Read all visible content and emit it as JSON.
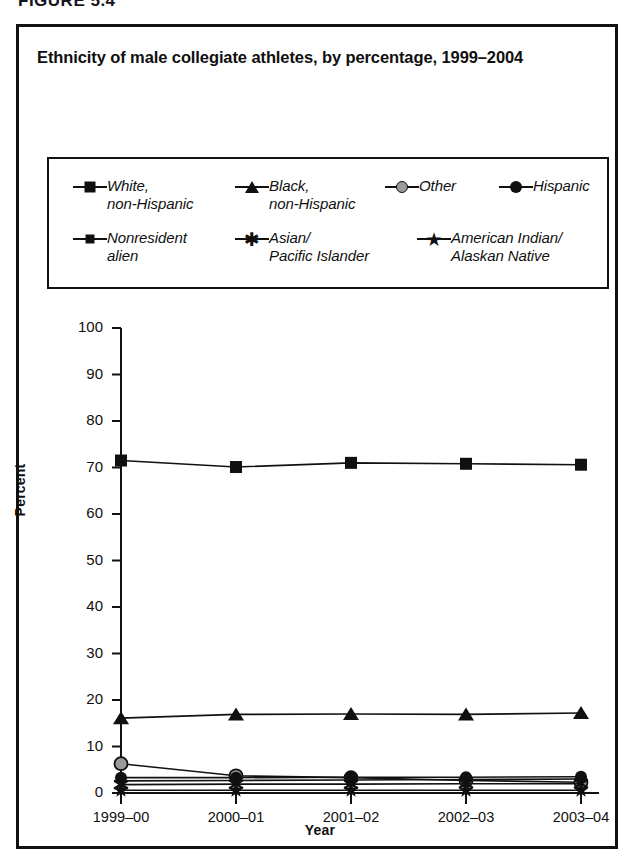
{
  "figure_caption": "FIGURE 5.4",
  "title": "Ethnicity of male collegiate athletes, by percentage, 1999–2004",
  "legend": {
    "items": [
      {
        "label": "White,\nnon-Hispanic",
        "marker": "square-filled-black",
        "color": "#101010"
      },
      {
        "label": "Black,\nnon-Hispanic",
        "marker": "triangle-filled-black",
        "color": "#101010"
      },
      {
        "label": "Other",
        "marker": "circle-filled-gray",
        "color": "#9b9b9b"
      },
      {
        "label": "Hispanic",
        "marker": "circle-filled-black",
        "color": "#101010"
      },
      {
        "label": "Nonresident\nalien",
        "marker": "diamond-filled-black",
        "color": "#101010"
      },
      {
        "label": "Asian/\nPacific Islander",
        "marker": "asterisk-black",
        "color": "#101010"
      },
      {
        "label": "American Indian/\nAlaskan Native",
        "marker": "star-filled-black",
        "color": "#101010"
      }
    ]
  },
  "chart_data": {
    "type": "line",
    "title": "Ethnicity of male collegiate athletes, by percentage, 1999–2004",
    "xlabel": "Year",
    "ylabel": "Percent",
    "categories": [
      "1999–00",
      "2000–01",
      "2001–02",
      "2002–03",
      "2003–04"
    ],
    "ylim": [
      0,
      100
    ],
    "yticks": [
      0,
      10,
      20,
      30,
      40,
      50,
      60,
      70,
      80,
      90,
      100
    ],
    "grid": false,
    "legend_position": "top",
    "series": [
      {
        "name": "White, non-Hispanic",
        "marker": "square-filled-black",
        "color": "#101010",
        "values": [
          71.5,
          70.1,
          71.0,
          70.8,
          70.6
        ]
      },
      {
        "name": "Black, non-Hispanic",
        "marker": "triangle-filled-black",
        "color": "#101010",
        "values": [
          16.1,
          16.9,
          17.0,
          16.9,
          17.2
        ]
      },
      {
        "name": "Other",
        "marker": "circle-filled-gray",
        "color": "#9b9b9b",
        "values": [
          6.3,
          3.7,
          3.3,
          2.7,
          2.3
        ]
      },
      {
        "name": "Hispanic",
        "marker": "circle-filled-black",
        "color": "#101010",
        "values": [
          3.3,
          3.3,
          3.4,
          3.4,
          3.5
        ]
      },
      {
        "name": "Nonresident alien",
        "marker": "diamond-filled-black",
        "color": "#101010",
        "values": [
          2.6,
          2.7,
          2.8,
          2.9,
          3.0
        ]
      },
      {
        "name": "Asian/Pacific Islander",
        "marker": "asterisk-black",
        "color": "#101010",
        "values": [
          1.8,
          1.9,
          1.9,
          2.0,
          2.0
        ]
      },
      {
        "name": "American Indian/Alaskan Native",
        "marker": "star-filled-black",
        "color": "#101010",
        "values": [
          0.6,
          0.6,
          0.6,
          0.6,
          0.6
        ]
      }
    ]
  }
}
